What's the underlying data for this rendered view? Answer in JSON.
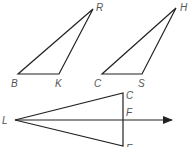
{
  "diagram": {
    "triangles": [
      {
        "name": "triangle-BKR",
        "vertices": {
          "B": {
            "x": 18,
            "y": 74,
            "label": "B",
            "lx": 11,
            "ly": 87
          },
          "K": {
            "x": 59,
            "y": 74,
            "label": "K",
            "lx": 55,
            "ly": 87
          },
          "R": {
            "x": 93,
            "y": 9,
            "label": "R",
            "lx": 96,
            "ly": 11
          }
        }
      },
      {
        "name": "triangle-CSH",
        "vertices": {
          "C": {
            "x": 102,
            "y": 74,
            "label": "C",
            "lx": 94,
            "ly": 87
          },
          "S": {
            "x": 142,
            "y": 74,
            "label": "S",
            "lx": 138,
            "ly": 87
          },
          "H": {
            "x": 176,
            "y": 8,
            "label": "H",
            "lx": 180,
            "ly": 11
          }
        }
      },
      {
        "name": "triangle-LCE",
        "vertices": {
          "L": {
            "x": 15,
            "y": 120,
            "label": "L",
            "lx": 2,
            "ly": 124
          },
          "C": {
            "x": 123,
            "y": 93,
            "label": "C",
            "lx": 126,
            "ly": 99
          },
          "E": {
            "x": 123,
            "y": 146,
            "label": "E",
            "lx": 126,
            "ly": 152
          }
        }
      }
    ],
    "ray": {
      "from": "L",
      "through": "F",
      "x1": 15,
      "y1": 120,
      "x2": 172,
      "y2": 120,
      "F": {
        "x": 123,
        "y": 120,
        "label": "F",
        "lx": 126,
        "ly": 116
      }
    },
    "colors": {
      "stroke": "#222222",
      "label": "#555555"
    }
  }
}
